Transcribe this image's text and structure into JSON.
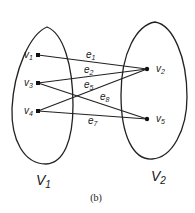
{
  "figure": {
    "caption": "(b)",
    "partitions": [
      {
        "id": "V1",
        "label": "V",
        "sub": "1"
      },
      {
        "id": "V2",
        "label": "V",
        "sub": "2"
      }
    ],
    "nodes": [
      {
        "id": "v1",
        "label": "v",
        "sub": "1",
        "set": "V1"
      },
      {
        "id": "v3",
        "label": "v",
        "sub": "3",
        "set": "V1"
      },
      {
        "id": "v4",
        "label": "v",
        "sub": "4",
        "set": "V1"
      },
      {
        "id": "v2",
        "label": "v",
        "sub": "2",
        "set": "V2"
      },
      {
        "id": "v5",
        "label": "v",
        "sub": "5",
        "set": "V2"
      }
    ],
    "edges": [
      {
        "id": "e1",
        "label": "e",
        "sub": "1",
        "from": "v1",
        "to": "v2"
      },
      {
        "id": "e2",
        "label": "e",
        "sub": "2",
        "from": "v3",
        "to": "v2"
      },
      {
        "id": "e5",
        "label": "e",
        "sub": "5",
        "from": "v4",
        "to": "v2"
      },
      {
        "id": "e8",
        "label": "e",
        "sub": "8",
        "from": "v3",
        "to": "v5"
      },
      {
        "id": "e7",
        "label": "e",
        "sub": "7",
        "from": "v4",
        "to": "v5"
      }
    ]
  }
}
